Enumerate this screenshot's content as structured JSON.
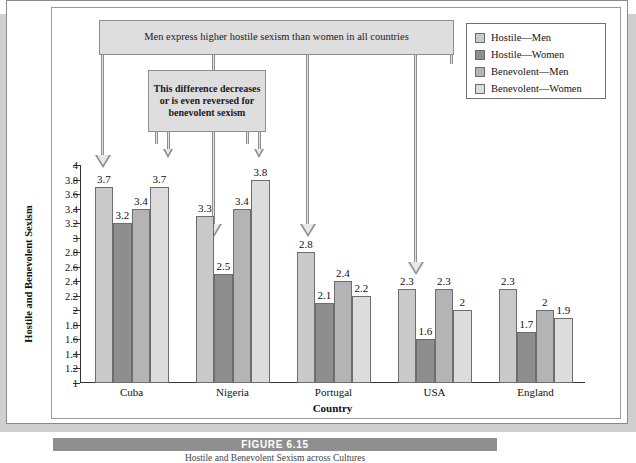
{
  "figure": {
    "number_label": "FIGURE 6.15",
    "caption": "Hostile and Benevolent Sexism across Cultures"
  },
  "annotations": {
    "top_callout": "Men express higher hostile sexism than women in all countries",
    "middle_callout": "This difference decreases or is even reversed for benevolent sexism"
  },
  "legend": {
    "items": [
      {
        "label": "Hostile—Men",
        "color": "#c9c9c9"
      },
      {
        "label": "Hostile—Women",
        "color": "#8e8e8e"
      },
      {
        "label": "Benevolent—Men",
        "color": "#b4b4b4"
      },
      {
        "label": "Benevolent—Women",
        "color": "#dcdcdc"
      }
    ]
  },
  "chart_data": {
    "type": "bar",
    "title": "",
    "xlabel": "Country",
    "ylabel": "Hostile and Benevolent Sexism",
    "categories": [
      "Cuba",
      "Nigeria",
      "Portugal",
      "USA",
      "England"
    ],
    "ylim": [
      1,
      4
    ],
    "ytick_labels": [
      "1",
      "1.2",
      "1.4",
      "1.6",
      "1.8",
      "2",
      "2.2",
      "2.4",
      "2.6",
      "2.8",
      "3",
      "3.2",
      "3.4",
      "3.6",
      "3.8",
      "4"
    ],
    "ytick_values": [
      1,
      1.2,
      1.4,
      1.6,
      1.8,
      2,
      2.2,
      2.4,
      2.6,
      2.8,
      3,
      3.2,
      3.4,
      3.6,
      3.8,
      4
    ],
    "grid": false,
    "legend_position": "top-right",
    "series": [
      {
        "name": "Hostile—Men",
        "color": "#c9c9c9",
        "values": [
          3.7,
          3.3,
          2.8,
          2.3,
          2.3
        ],
        "labels": [
          "3.7",
          "3.3",
          "2.8",
          "2.3",
          "2.3"
        ]
      },
      {
        "name": "Hostile—Women",
        "color": "#8e8e8e",
        "values": [
          3.2,
          2.5,
          2.1,
          1.6,
          1.7
        ],
        "labels": [
          "3.2",
          "2.5",
          "2.1",
          "1.6",
          "1.7"
        ]
      },
      {
        "name": "Benevolent—Men",
        "color": "#b4b4b4",
        "values": [
          3.4,
          3.4,
          2.4,
          2.3,
          2.0
        ],
        "labels": [
          "3.4",
          "3.4",
          "2.4",
          "2.3",
          "2"
        ]
      },
      {
        "name": "Benevolent—Women",
        "color": "#dcdcdc",
        "values": [
          3.7,
          3.8,
          2.2,
          2.0,
          1.9
        ],
        "labels": [
          "3.7",
          "3.8",
          "2.2",
          "2",
          "1.9"
        ]
      }
    ]
  }
}
